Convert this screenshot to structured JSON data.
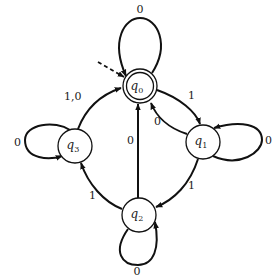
{
  "diagram": {
    "type": "finite-state-automaton",
    "colors": {
      "stroke": "#111111",
      "background": "#ffffff"
    },
    "states": [
      {
        "id": "q0",
        "name": "q",
        "sub": "0",
        "x": 140,
        "y": 86,
        "accepting": true,
        "initial": true
      },
      {
        "id": "q1",
        "name": "q",
        "sub": "1",
        "x": 203,
        "y": 142,
        "accepting": false,
        "initial": false
      },
      {
        "id": "q2",
        "name": "q",
        "sub": "2",
        "x": 139,
        "y": 215,
        "accepting": false,
        "initial": false
      },
      {
        "id": "q3",
        "name": "q",
        "sub": "3",
        "x": 75,
        "y": 146,
        "accepting": false,
        "initial": false
      }
    ],
    "transitions": [
      {
        "from": "q0",
        "to": "q0",
        "label": "0"
      },
      {
        "from": "q0",
        "to": "q1",
        "label": "1"
      },
      {
        "from": "q1",
        "to": "q0",
        "label": "0"
      },
      {
        "from": "q1",
        "to": "q1",
        "label": "0"
      },
      {
        "from": "q1",
        "to": "q2",
        "label": "1"
      },
      {
        "from": "q2",
        "to": "q0",
        "label": "0"
      },
      {
        "from": "q2",
        "to": "q2",
        "label": "0"
      },
      {
        "from": "q2",
        "to": "q3",
        "label": "1"
      },
      {
        "from": "q3",
        "to": "q3",
        "label": "0"
      },
      {
        "from": "q3",
        "to": "q0",
        "label": "1,0"
      }
    ]
  },
  "labels": {
    "q0_name": "q",
    "q0_sub": "0",
    "q1_name": "q",
    "q1_sub": "1",
    "q2_name": "q",
    "q2_sub": "2",
    "q3_name": "q",
    "q3_sub": "3",
    "q0_self": "0",
    "q0_q1": "1",
    "q1_q0": "0",
    "q1_self": "0",
    "q1_q2": "1",
    "q2_q0": "0",
    "q2_self": "0",
    "q2_q3": "1",
    "q3_self": "0",
    "q3_q0": "1,0"
  }
}
